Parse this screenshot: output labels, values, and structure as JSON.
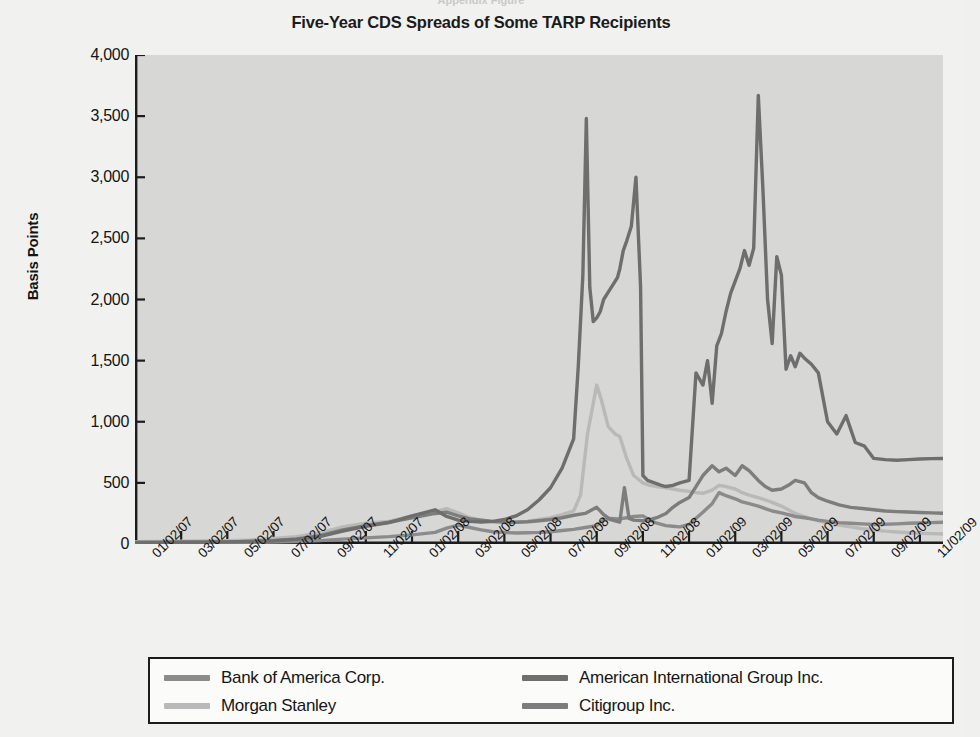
{
  "figure": {
    "top_clipped_text": "Appendix Figure",
    "background_color": "#f1f1ef",
    "plot_background_color": "#d7d7d5",
    "axis_color": "#1c1c1c"
  },
  "chart_data": {
    "type": "line",
    "title": "Five-Year CDS Spreads of Some TARP Recipients",
    "xlabel": "",
    "ylabel": "Basis Points",
    "ylim": [
      0,
      4000
    ],
    "yticks": [
      0,
      500,
      1000,
      1500,
      2000,
      2500,
      3000,
      3500,
      4000
    ],
    "ytick_labels": [
      "0",
      "500",
      "1,000",
      "1,500",
      "2,000",
      "2,500",
      "3,000",
      "3,500",
      "4,000"
    ],
    "grid": false,
    "legend_position": "below-axes",
    "x_tick_labels": [
      "01/02/07",
      "03/02/07",
      "05/02/07",
      "07/02/07",
      "09/02/07",
      "11/02/07",
      "01/02/08",
      "03/02/08",
      "05/02/08",
      "07/02/08",
      "09/02/08",
      "11/02/08",
      "01/02/09",
      "03/02/09",
      "05/02/09",
      "07/02/09",
      "09/02/09",
      "11/02/09"
    ],
    "x_tick_positions": [
      0,
      2,
      4,
      6,
      8,
      10,
      12,
      14,
      16,
      18,
      20,
      22,
      24,
      26,
      28,
      30,
      32,
      34
    ],
    "x_units": "months since 01/02/2007",
    "xlim": [
      0,
      35
    ],
    "series": [
      {
        "name": "Bank of America Corp.",
        "color": "#8b8b8b",
        "x": [
          0,
          1,
          2,
          3,
          4,
          5,
          6,
          7,
          8,
          9,
          10,
          11,
          12,
          13,
          13.5,
          14,
          14.5,
          15,
          15.5,
          16,
          16.5,
          17,
          17.5,
          18,
          18.5,
          19,
          19.5,
          20,
          20.3,
          20.6,
          21,
          21.3,
          21.6,
          22,
          22.3,
          22.6,
          23,
          23.3,
          23.6,
          24,
          24.3,
          24.6,
          25,
          25.3,
          25.6,
          26,
          26.3,
          26.6,
          27,
          27.3,
          27.6,
          28,
          28.3,
          28.6,
          29,
          29.3,
          29.6,
          30,
          30.5,
          31,
          31.5,
          32,
          32.5,
          33,
          33.5,
          34,
          34.5,
          35
        ],
        "y": [
          10,
          11,
          12,
          12,
          13,
          14,
          16,
          20,
          28,
          40,
          50,
          60,
          75,
          95,
          130,
          155,
          135,
          115,
          100,
          95,
          90,
          92,
          95,
          100,
          110,
          120,
          135,
          150,
          200,
          210,
          205,
          215,
          225,
          230,
          195,
          170,
          150,
          145,
          140,
          160,
          210,
          260,
          330,
          420,
          395,
          370,
          345,
          330,
          310,
          290,
          270,
          255,
          240,
          225,
          215,
          205,
          195,
          185,
          175,
          170,
          165,
          160,
          162,
          165,
          170,
          172,
          175,
          178
        ]
      },
      {
        "name": "Morgan Stanley",
        "color": "#b9b9b9",
        "x": [
          0,
          1,
          2,
          3,
          4,
          5,
          6,
          7,
          8,
          9,
          10,
          11,
          12,
          13,
          13.5,
          14,
          14.5,
          15,
          15.5,
          16,
          16.5,
          17,
          17.5,
          18,
          18.5,
          19,
          19.3,
          19.6,
          20,
          20.2,
          20.5,
          20.8,
          21,
          21.3,
          21.6,
          22,
          22.3,
          22.6,
          23,
          23.3,
          23.6,
          24,
          24.3,
          24.6,
          25,
          25.3,
          25.6,
          26,
          26.3,
          26.6,
          27,
          27.3,
          27.6,
          28,
          28.3,
          28.6,
          29,
          29.3,
          29.6,
          30,
          30.5,
          31,
          31.5,
          32,
          32.5,
          33,
          33.5,
          34,
          34.5,
          35
        ],
        "y": [
          18,
          20,
          22,
          24,
          28,
          34,
          45,
          60,
          90,
          140,
          170,
          185,
          230,
          265,
          290,
          255,
          215,
          195,
          180,
          175,
          178,
          185,
          200,
          215,
          240,
          270,
          400,
          900,
          1300,
          1180,
          960,
          900,
          880,
          700,
          560,
          500,
          480,
          470,
          460,
          450,
          440,
          430,
          420,
          415,
          440,
          480,
          470,
          450,
          420,
          400,
          380,
          360,
          340,
          310,
          280,
          250,
          225,
          205,
          190,
          175,
          155,
          140,
          125,
          115,
          105,
          98,
          92,
          88,
          85,
          82
        ]
      },
      {
        "name": "American International Group Inc.",
        "color": "#6e6e6e",
        "x": [
          0,
          1,
          2,
          3,
          4,
          5,
          6,
          7,
          8,
          9,
          10,
          11,
          12,
          13,
          13.5,
          14,
          14.5,
          15,
          15.5,
          16,
          16.5,
          17,
          17.5,
          18,
          18.5,
          19,
          19.2,
          19.4,
          19.55,
          19.7,
          19.85,
          20,
          20.15,
          20.3,
          20.5,
          20.7,
          20.9,
          21,
          21.15,
          21.3,
          21.5,
          21.7,
          21.9,
          22,
          22.2,
          22.5,
          22.8,
          23,
          23.3,
          23.6,
          24,
          24.3,
          24.6,
          24.8,
          25,
          25.2,
          25.4,
          25.6,
          25.8,
          26,
          26.2,
          26.4,
          26.6,
          26.8,
          27,
          27.2,
          27.4,
          27.6,
          27.8,
          28,
          28.2,
          28.4,
          28.6,
          28.8,
          29,
          29.3,
          29.6,
          30,
          30.4,
          30.8,
          31.2,
          31.6,
          32,
          32.5,
          33,
          33.5,
          34,
          34.5,
          35
        ],
        "y": [
          12,
          13,
          14,
          15,
          17,
          20,
          26,
          38,
          60,
          105,
          145,
          175,
          230,
          280,
          225,
          195,
          185,
          180,
          185,
          200,
          230,
          280,
          360,
          460,
          620,
          860,
          1450,
          2200,
          3480,
          2100,
          1820,
          1850,
          1900,
          2000,
          2060,
          2120,
          2180,
          2250,
          2400,
          2480,
          2600,
          3000,
          2100,
          560,
          520,
          500,
          480,
          470,
          480,
          500,
          520,
          1400,
          1300,
          1500,
          1150,
          1620,
          1720,
          1900,
          2050,
          2150,
          2250,
          2400,
          2280,
          2420,
          3670,
          2900,
          2000,
          1640,
          2350,
          2200,
          1430,
          1540,
          1450,
          1560,
          1520,
          1470,
          1400,
          1000,
          900,
          1050,
          830,
          800,
          700,
          690,
          685,
          690,
          695,
          698,
          700
        ]
      },
      {
        "name": "Citigroup Inc.",
        "color": "#7d7d7d",
        "x": [
          0,
          1,
          2,
          3,
          4,
          5,
          6,
          7,
          8,
          9,
          10,
          11,
          12,
          13,
          13.5,
          14,
          14.5,
          15,
          15.5,
          16,
          16.5,
          17,
          17.5,
          18,
          18.5,
          19,
          19.5,
          20,
          20.3,
          20.6,
          21,
          21.2,
          21.4,
          21.6,
          22,
          22.3,
          22.6,
          23,
          23.3,
          23.6,
          24,
          24.3,
          24.6,
          25,
          25.3,
          25.6,
          26,
          26.3,
          26.6,
          27,
          27.3,
          27.6,
          28,
          28.3,
          28.6,
          29,
          29.3,
          29.6,
          30,
          30.5,
          31,
          31.5,
          32,
          32.5,
          33,
          33.5,
          34,
          34.5,
          35
        ],
        "y": [
          12,
          13,
          14,
          15,
          17,
          21,
          28,
          42,
          68,
          115,
          150,
          178,
          215,
          250,
          260,
          230,
          205,
          195,
          185,
          180,
          178,
          182,
          190,
          200,
          215,
          235,
          250,
          300,
          240,
          200,
          180,
          460,
          210,
          195,
          190,
          200,
          215,
          250,
          300,
          340,
          380,
          470,
          560,
          640,
          590,
          620,
          560,
          640,
          600,
          520,
          470,
          440,
          450,
          480,
          520,
          500,
          420,
          380,
          350,
          320,
          300,
          290,
          280,
          270,
          265,
          262,
          258,
          255,
          252
        ]
      }
    ]
  },
  "legend": {
    "items": [
      {
        "label": "Bank of America Corp.",
        "color": "#8b8b8b"
      },
      {
        "label": "Morgan Stanley",
        "color": "#b9b9b9"
      },
      {
        "label": "American International Group Inc.",
        "color": "#6e6e6e"
      },
      {
        "label": "Citigroup Inc.",
        "color": "#7d7d7d"
      }
    ]
  }
}
